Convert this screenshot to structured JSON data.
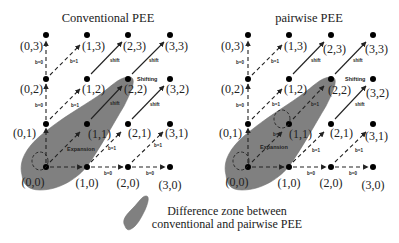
{
  "panels": [
    {
      "title": "Conventional PEE",
      "points": [
        {
          "label": "(0,0)"
        },
        {
          "label": "(1,0)"
        },
        {
          "label": "(2,0)"
        },
        {
          "label": "(3,0)"
        },
        {
          "label": "(0,1)"
        },
        {
          "label": "(1,1)"
        },
        {
          "label": "(2,1)"
        },
        {
          "label": "(3,1)"
        },
        {
          "label": "(0,2)"
        },
        {
          "label": "(1,2)"
        },
        {
          "label": "(2,2)"
        },
        {
          "label": "(3,2)"
        },
        {
          "label": "(0,3)"
        },
        {
          "label": "(1,3)"
        },
        {
          "label": "(2,3)"
        },
        {
          "label": "(3,3)"
        }
      ],
      "edge_labels": {
        "b0": "b=0",
        "b1": "b=1",
        "shift": "shift",
        "shifting": "Shifting",
        "expansion": "Expansion"
      }
    },
    {
      "title": "pairwise PEE",
      "points": [
        {
          "label": "(0,0)"
        },
        {
          "label": "(1,0)"
        },
        {
          "label": "(2,0)"
        },
        {
          "label": "(3,0)"
        },
        {
          "label": "(0,1)"
        },
        {
          "label": "(1,1)"
        },
        {
          "label": "(2,1)"
        },
        {
          "label": "(3,1)"
        },
        {
          "label": "(0,2)"
        },
        {
          "label": "(1,2)"
        },
        {
          "label": "(2,2)"
        },
        {
          "label": "(3,2)"
        },
        {
          "label": "(0,3)"
        },
        {
          "label": "(1,3)"
        },
        {
          "label": "(2,3)"
        },
        {
          "label": "(3,3)"
        }
      ],
      "edge_labels": {
        "b0": "b=0",
        "b1": "b=1",
        "shift": "shift",
        "shifting": "Shifting",
        "expansion": "Expansion"
      }
    }
  ],
  "legend": {
    "line1": "Difference zone between",
    "line2": "conventional and pairwise PEE",
    "zone_color": "#7a7a7a"
  }
}
